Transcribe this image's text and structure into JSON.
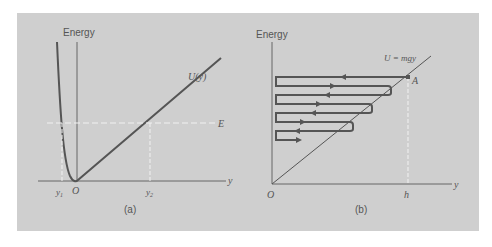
{
  "figure": {
    "panel_a": {
      "caption": "(a)",
      "y_axis_label": "Energy",
      "x_axis_label": "y",
      "curve_label": "U(y)",
      "energy_level_label": "E",
      "origin_label": "O",
      "turning_point_left": "y",
      "turning_point_left_sub": "1",
      "turning_point_right": "y",
      "turning_point_right_sub": "2"
    },
    "panel_b": {
      "caption": "(b)",
      "y_axis_label": "Energy",
      "x_axis_label": "y",
      "line_label": "U = mgy",
      "point_label": "A",
      "origin_label": "O",
      "height_label": "h"
    }
  },
  "colors": {
    "background": "#cfcfcf",
    "stroke": "#555555",
    "dashed": "#f2f2f2"
  }
}
